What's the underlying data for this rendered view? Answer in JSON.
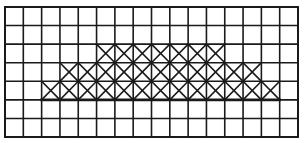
{
  "diagram": {
    "type": "grid",
    "rows": 7,
    "cols": 16,
    "origin": {
      "x": 5,
      "y": 7
    },
    "size": {
      "width": 293,
      "height": 130
    },
    "line_color": "#1a1a1a",
    "background": "#ffffff",
    "crossed_cells": [
      {
        "row": 2,
        "col_start": 5,
        "col_end": 11
      },
      {
        "row": 3,
        "col_start": 3,
        "col_end": 13
      },
      {
        "row": 4,
        "col_start": 2,
        "col_end": 14
      }
    ],
    "emphasis_line": {
      "row_boundary": 5,
      "col_start": 2,
      "col_end": 15
    }
  }
}
